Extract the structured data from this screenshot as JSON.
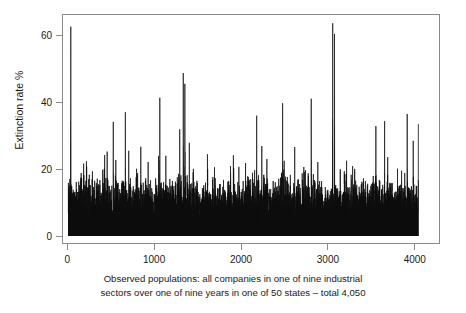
{
  "chart_data": {
    "type": "line",
    "title": "",
    "subtitle": "",
    "xlabel": "Observed populations: all companies in one of nine industrial sectors over one of nine years in one of 50 states – total 4,050",
    "ylabel": "Extinction rate %",
    "xlim": [
      -60,
      4290
    ],
    "ylim": [
      -2.2,
      66.5
    ],
    "grid": false,
    "legend": null,
    "series_color": "#0d0d0d",
    "frame_color": "#8a8a8a",
    "background": "#ffffff",
    "n_points": 4050,
    "x_ticks": [
      0,
      1000,
      2000,
      3000,
      4000
    ],
    "x_tick_labels": [
      "0",
      "1000",
      "2000",
      "3000",
      "4000"
    ],
    "y_ticks": [
      0,
      20,
      40,
      60
    ],
    "y_tick_labels": [
      "0",
      "20",
      "40",
      "60"
    ],
    "baseline_mean": 9.5,
    "baseline_sd": 3.4,
    "value_min": 0,
    "value_max": 64,
    "notable_peaks": [
      {
        "x": 30,
        "y": 63.0
      },
      {
        "x": 210,
        "y": 22.4
      },
      {
        "x": 520,
        "y": 34.3
      },
      {
        "x": 660,
        "y": 37.2
      },
      {
        "x": 700,
        "y": 25.6
      },
      {
        "x": 840,
        "y": 26.8
      },
      {
        "x": 1060,
        "y": 41.6
      },
      {
        "x": 1130,
        "y": 24.1
      },
      {
        "x": 1290,
        "y": 32.0
      },
      {
        "x": 1330,
        "y": 49.0
      },
      {
        "x": 1350,
        "y": 45.8
      },
      {
        "x": 1400,
        "y": 28.0
      },
      {
        "x": 1610,
        "y": 24.5
      },
      {
        "x": 1910,
        "y": 24.2
      },
      {
        "x": 2180,
        "y": 36.2
      },
      {
        "x": 2240,
        "y": 27.0
      },
      {
        "x": 2480,
        "y": 39.9
      },
      {
        "x": 2620,
        "y": 26.7
      },
      {
        "x": 2810,
        "y": 41.3
      },
      {
        "x": 3060,
        "y": 64.0
      },
      {
        "x": 3080,
        "y": 60.8
      },
      {
        "x": 3220,
        "y": 22.6
      },
      {
        "x": 3290,
        "y": 21.0
      },
      {
        "x": 3560,
        "y": 33.0
      },
      {
        "x": 3660,
        "y": 34.5
      },
      {
        "x": 3920,
        "y": 36.7
      },
      {
        "x": 3990,
        "y": 28.6
      },
      {
        "x": 4110,
        "y": 31.0
      },
      {
        "x": 4260,
        "y": 29.1
      },
      {
        "x": 4400,
        "y": 32.8
      },
      {
        "x": 4520,
        "y": 30.2
      },
      {
        "x": 4700,
        "y": 33.6
      }
    ]
  },
  "axes": {
    "y_title": "Extinction rate %",
    "y_ticks": [
      {
        "label": "60",
        "value": 60
      },
      {
        "label": "40",
        "value": 40
      },
      {
        "label": "20",
        "value": 20
      },
      {
        "label": "0",
        "value": 0
      }
    ],
    "x_ticks": [
      {
        "label": "0",
        "value": 0
      },
      {
        "label": "1000",
        "value": 1000
      },
      {
        "label": "2000",
        "value": 2000
      },
      {
        "label": "3000",
        "value": 3000
      },
      {
        "label": "4000",
        "value": 4000
      }
    ]
  },
  "caption": {
    "line1": "Observed populations: all companies in one of nine industrial",
    "line2": "sectors over one of nine years in one of 50 states – total 4,050"
  }
}
